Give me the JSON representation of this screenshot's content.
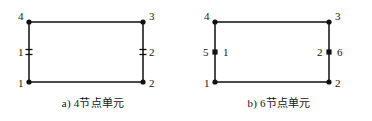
{
  "figure": {
    "background_color": "#ffffff",
    "line_color": "#4a4a4a",
    "node_color": "#111111",
    "text_color": "#141414"
  },
  "panels": [
    {
      "id": "a",
      "caption": "a) 4节点单元",
      "rect": {
        "x1": 29,
        "y1": 22,
        "x2": 143,
        "y2": 82
      },
      "nodes": [
        {
          "name": "corner-top-left",
          "x": 29,
          "y": 22,
          "shape": "dot"
        },
        {
          "name": "corner-top-right",
          "x": 143,
          "y": 22,
          "shape": "dot"
        },
        {
          "name": "corner-bottom-left",
          "x": 29,
          "y": 82,
          "shape": "dot"
        },
        {
          "name": "corner-bottom-right",
          "x": 143,
          "y": 82,
          "shape": "dot"
        },
        {
          "name": "edge-marker-left",
          "x": 29,
          "y": 52,
          "shape": "tick"
        },
        {
          "name": "edge-marker-right",
          "x": 143,
          "y": 52,
          "shape": "tick"
        }
      ],
      "labels": [
        {
          "name": "node-label-4",
          "text": "4",
          "x": 18,
          "y": 11
        },
        {
          "name": "node-label-3",
          "text": "3",
          "x": 149,
          "y": 11
        },
        {
          "name": "node-label-1-bottom",
          "text": "1",
          "x": 18,
          "y": 78
        },
        {
          "name": "node-label-2-bottom",
          "text": "2",
          "x": 149,
          "y": 78
        },
        {
          "name": "edge-label-1",
          "text": "1",
          "x": 18,
          "y": 47
        },
        {
          "name": "edge-label-2",
          "text": "2",
          "x": 149,
          "y": 47
        }
      ]
    },
    {
      "id": "b",
      "caption": "b) 6节点单元",
      "rect": {
        "x1": 29,
        "y1": 22,
        "x2": 143,
        "y2": 82
      },
      "nodes": [
        {
          "name": "corner-top-left",
          "x": 29,
          "y": 22,
          "shape": "dot"
        },
        {
          "name": "corner-top-right",
          "x": 143,
          "y": 22,
          "shape": "dot"
        },
        {
          "name": "corner-bottom-left",
          "x": 29,
          "y": 82,
          "shape": "dot"
        },
        {
          "name": "corner-bottom-right",
          "x": 143,
          "y": 82,
          "shape": "dot"
        },
        {
          "name": "midside-node-left",
          "x": 29,
          "y": 52,
          "shape": "square"
        },
        {
          "name": "midside-node-right",
          "x": 143,
          "y": 52,
          "shape": "square"
        }
      ],
      "labels": [
        {
          "name": "node-label-4",
          "text": "4",
          "x": 18,
          "y": 11
        },
        {
          "name": "node-label-3",
          "text": "3",
          "x": 149,
          "y": 11
        },
        {
          "name": "node-label-1-bottom",
          "text": "1",
          "x": 18,
          "y": 78
        },
        {
          "name": "node-label-2-bottom",
          "text": "2",
          "x": 149,
          "y": 78
        },
        {
          "name": "node-label-5",
          "text": "5",
          "x": 17,
          "y": 47
        },
        {
          "name": "edge-label-1",
          "text": "1",
          "x": 37,
          "y": 47
        },
        {
          "name": "edge-label-2",
          "text": "2",
          "x": 131,
          "y": 47
        },
        {
          "name": "node-label-6",
          "text": "6",
          "x": 151,
          "y": 47
        }
      ]
    }
  ]
}
